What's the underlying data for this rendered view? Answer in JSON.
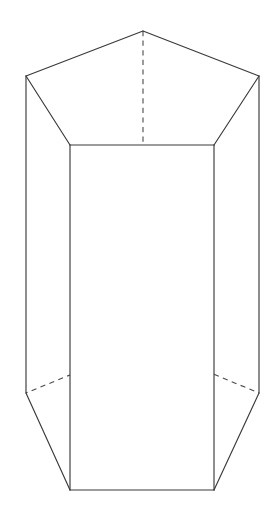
{
  "figure": {
    "name": "pentagonal-prism",
    "background_color": "#ffffff",
    "visible_edge_color": "#3a3a3a",
    "hidden_edge_color": "#4a4a4a",
    "visible_edge_width": 1.15,
    "hidden_edge_width": 1.1,
    "hidden_dash_pattern": "5.2 4.4",
    "canvas": {
      "width": 274,
      "height": 511
    },
    "vertices": {
      "top_apex_back": {
        "x": 143,
        "y": 31
      },
      "top_left_outer": {
        "x": 26,
        "y": 76
      },
      "top_right_outer": {
        "x": 259,
        "y": 76
      },
      "top_front_left": {
        "x": 70,
        "y": 145
      },
      "top_front_right": {
        "x": 214,
        "y": 145
      },
      "bottom_apex_back": {
        "x": 143,
        "y": 345
      },
      "bottom_left_outer": {
        "x": 26,
        "y": 393
      },
      "bottom_right_outer": {
        "x": 259,
        "y": 393
      },
      "bottom_front_left": {
        "x": 70,
        "y": 490
      },
      "bottom_front_right": {
        "x": 214,
        "y": 490
      }
    },
    "edges_visible": [
      {
        "name": "top-apex-to-left-outer",
        "from": "top_apex_back",
        "to": "top_left_outer"
      },
      {
        "name": "top-apex-to-right-outer",
        "from": "top_apex_back",
        "to": "top_right_outer"
      },
      {
        "name": "top-left-outer-to-front-left",
        "from": "top_left_outer",
        "to": "top_front_left"
      },
      {
        "name": "top-right-outer-to-front-right",
        "from": "top_right_outer",
        "to": "top_front_right"
      },
      {
        "name": "top-front-edge",
        "from": "top_front_left",
        "to": "top_front_right"
      },
      {
        "name": "left-outer-vertical",
        "from": "top_left_outer",
        "to": "bottom_left_outer"
      },
      {
        "name": "right-outer-vertical",
        "from": "top_right_outer",
        "to": "bottom_right_outer"
      },
      {
        "name": "front-left-vertical",
        "from": "top_front_left",
        "to": "bottom_front_left"
      },
      {
        "name": "front-right-vertical",
        "from": "top_front_right",
        "to": "bottom_front_right"
      },
      {
        "name": "bottom-left-outer-to-front-left",
        "from": "bottom_left_outer",
        "to": "bottom_front_left"
      },
      {
        "name": "bottom-right-outer-to-front-right",
        "from": "bottom_right_outer",
        "to": "bottom_front_right"
      },
      {
        "name": "bottom-front-edge",
        "from": "bottom_front_left",
        "to": "bottom_front_right"
      }
    ],
    "edges_hidden": [
      {
        "name": "hidden-back-vertical",
        "from": "top_apex_back",
        "to": "bottom_apex_back"
      },
      {
        "name": "hidden-bottom-apex-to-left-outer",
        "from": "bottom_apex_back",
        "to": "bottom_left_outer"
      },
      {
        "name": "hidden-bottom-apex-to-right-outer",
        "from": "bottom_apex_back",
        "to": "bottom_right_outer"
      }
    ],
    "paths": {
      "top_face_outline": "M 143,31 L 259,76 L 214,145 L 70,145 L 26,76 Z",
      "left_face_outline": "M 26,76 L 70,145 L 70,490 L 26,393 Z",
      "front_face_outline": "M 70,145 L 214,145 L 214,490 L 70,490 Z",
      "right_face_outline": "M 214,145 L 259,76 L 259,393 L 214,490 Z",
      "top_apex_left": "M 143,31 L 26,76",
      "top_apex_right": "M 143,31 L 259,76",
      "top_left_slant": "M 26,76 L 70,145",
      "top_right_slant": "M 259,76 L 214,145",
      "top_front_edge": "M 70,145 L 214,145",
      "left_outer_vertical": "M 26,76 L 26,393",
      "right_outer_vertical": "M 259,76 L 259,393",
      "front_left_vertical": "M 70,145 L 70,490",
      "front_right_vertical": "M 214,145 L 214,490",
      "bottom_left_slant": "M 26,393 L 70,490",
      "bottom_right_slant": "M 259,393 L 214,490",
      "bottom_front_edge": "M 70,490 L 214,490",
      "hidden_back_vertical": "M 143,31 L 143,345",
      "hidden_bottom_left": "M 143,345 L 26,393",
      "hidden_bottom_right": "M 143,345 L 259,393"
    }
  }
}
